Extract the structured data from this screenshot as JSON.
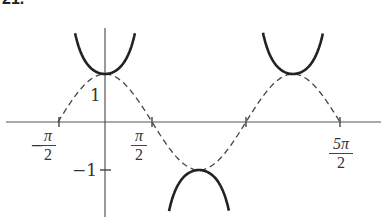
{
  "problem_number": "21.",
  "chart_data": {
    "type": "line",
    "title": "",
    "xlabel": "",
    "ylabel": "",
    "series": [
      {
        "name": "y = sec x",
        "style": "solid",
        "branches": [
          {
            "x_range": [
              -1.0,
              1.0
            ],
            "vertex": [
              0,
              1
            ]
          },
          {
            "x_range": [
              2.14,
              4.14
            ],
            "vertex": [
              3.14159,
              -1
            ]
          },
          {
            "x_range": [
              5.28,
              7.28
            ],
            "vertex": [
              6.28318,
              1
            ]
          }
        ]
      },
      {
        "name": "y = cos x",
        "style": "dashed",
        "x_range": [
          -1.5708,
          7.854
        ]
      }
    ],
    "x_ticks": [
      {
        "value": -1.5708,
        "label_num": "π",
        "label_den": "2",
        "sign": "−"
      },
      {
        "value": 1.5708,
        "label_num": "π",
        "label_den": "2",
        "sign": ""
      },
      {
        "value": 7.854,
        "label_num": "5π",
        "label_den": "2",
        "sign": ""
      }
    ],
    "y_ticks": [
      {
        "value": 1,
        "label": "1"
      },
      {
        "value": -1,
        "label": "−1"
      }
    ],
    "xlim": [
      -2.2,
      8.5
    ],
    "ylim": [
      -2.0,
      2.55
    ],
    "grid": false,
    "legend": "none"
  },
  "labels": {
    "y1": "1",
    "yneg1": "−1",
    "x_neg_pi_2_sign": "−",
    "x_neg_pi_2_num": "π",
    "x_neg_pi_2_den": "2",
    "x_pi_2_num": "π",
    "x_pi_2_den": "2",
    "x_5pi_2_num": "5π",
    "x_5pi_2_den": "2"
  }
}
